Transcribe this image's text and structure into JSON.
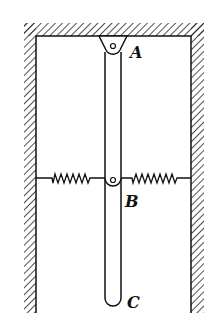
{
  "diagram": {
    "labels": {
      "A": "A",
      "B": "B",
      "C": "C"
    },
    "elements": [
      {
        "name": "ceiling",
        "type": "fixed-support-hatched"
      },
      {
        "name": "left-wall",
        "type": "fixed-support-hatched"
      },
      {
        "name": "right-wall",
        "type": "fixed-support-hatched"
      },
      {
        "name": "rod",
        "type": "rigid-bar",
        "from": "A",
        "to": "C"
      },
      {
        "name": "pivot-A",
        "type": "pin-support"
      },
      {
        "name": "pin-B",
        "type": "pin-joint"
      },
      {
        "name": "left-spring",
        "type": "spring",
        "connects": [
          "left-wall",
          "B"
        ]
      },
      {
        "name": "right-spring",
        "type": "spring",
        "connects": [
          "B",
          "right-wall"
        ]
      }
    ]
  }
}
